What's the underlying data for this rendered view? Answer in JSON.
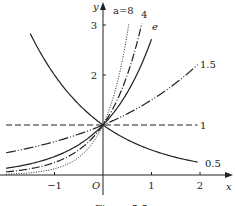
{
  "chart_data": {
    "type": "line",
    "title": "",
    "caption": "Figure 5.5",
    "xlabel": "x",
    "ylabel": "y",
    "origin_label": "O",
    "xlim": [
      -2,
      2.5
    ],
    "ylim": [
      0,
      3.3
    ],
    "x_ticks": [
      -1,
      1,
      2
    ],
    "x_tick_labels": [
      "−1",
      "1",
      "2"
    ],
    "y_ticks": [
      2,
      3
    ],
    "y_tick_labels": [
      "2",
      "3"
    ],
    "grid": false,
    "function": "y = a^x",
    "series": [
      {
        "name": "a=8",
        "label": "a=8",
        "base": 8,
        "style": "dotted",
        "x_range": [
          -2,
          0.53
        ]
      },
      {
        "name": "4",
        "label": "4",
        "base": 4,
        "style": "dash-dot",
        "x_range": [
          -2,
          0.8
        ]
      },
      {
        "name": "e",
        "label": "e",
        "base": 2.718,
        "style": "solid",
        "x_range": [
          -2,
          1.0
        ]
      },
      {
        "name": "1.5",
        "label": "1.5",
        "base": 1.5,
        "style": "dash-dot-dot",
        "x_range": [
          -2,
          1.95
        ]
      },
      {
        "name": "1",
        "label": "1",
        "base": 1,
        "style": "dashed",
        "x_range": [
          -2,
          1.95
        ]
      },
      {
        "name": "0.5",
        "label": "0.5",
        "base": 0.5,
        "style": "solid",
        "x_range": [
          -1.5,
          1.95
        ]
      }
    ]
  }
}
